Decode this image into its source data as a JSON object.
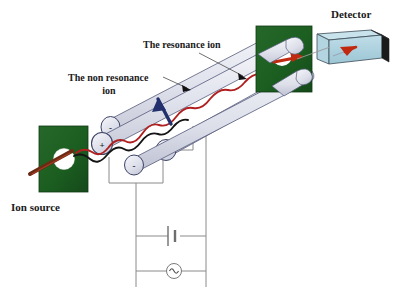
{
  "figure": {
    "title_visible": false,
    "background": "#ffffff",
    "labels": {
      "detector": "Detector",
      "ion_source": "Ion source",
      "resonance_ion": "The resonance ion",
      "non_resonance_ion_line1": "The non resonance",
      "non_resonance_ion_line2": "ion"
    },
    "electrodes": [
      {
        "name": "rod-top-rear",
        "sign": "-"
      },
      {
        "name": "rod-left-front",
        "sign": "+"
      },
      {
        "name": "rod-right-front",
        "sign": "+"
      },
      {
        "name": "rod-bottom-front",
        "sign": "-"
      }
    ],
    "circuit": {
      "dc_source_name": "dc-battery",
      "ac_source_name": "ac-generator",
      "ac_symbol": "∿"
    },
    "colors": {
      "block_green": "#1b5e20",
      "block_green_dark": "#12421a",
      "detector_blue": "#a9cfdc",
      "detector_blue_top": "#c4e0ea",
      "detector_dark_edge": "#1b1b1b",
      "rod_body": "#dcdde8",
      "rod_body_light": "#eceef5",
      "rod_outline": "#4a4f72",
      "resonance_trace": "#b02020",
      "non_resonance_trace": "#141414",
      "non_resonance_arrow": "#22306e",
      "detector_arrow": "#c02a10",
      "wire": "#8a8a8a",
      "aperture_white": "#ffffff",
      "ion_beam_brown": "#6b2a14"
    }
  }
}
